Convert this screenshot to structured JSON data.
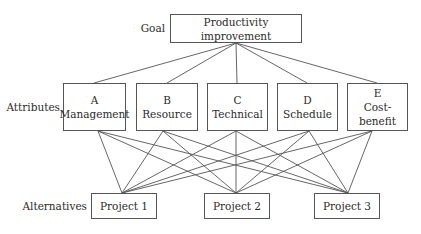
{
  "goal": {
    "label": "Goal",
    "text": "Productivity improvement"
  },
  "attributes": {
    "label": "Attributes",
    "items": [
      {
        "letter": "A",
        "name": "Management"
      },
      {
        "letter": "B",
        "name": "Resource"
      },
      {
        "letter": "C",
        "name": "Technical"
      },
      {
        "letter": "D",
        "name": "Schedule"
      },
      {
        "letter": "E",
        "name": "Cost-benefit"
      }
    ]
  },
  "alternatives": {
    "label": "Alternatives",
    "items": [
      {
        "name": "Project 1"
      },
      {
        "name": "Project 2"
      },
      {
        "name": "Project 3"
      }
    ]
  },
  "colors": {
    "line": "#555555",
    "text": "#2a2a2a"
  }
}
